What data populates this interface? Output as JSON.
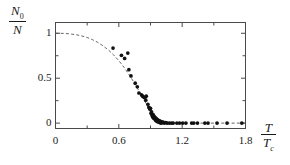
{
  "chart_data": {
    "type": "scatter",
    "title": "",
    "subtitle": "",
    "xlabel": "T/Tc",
    "xlabel_num": "T",
    "xlabel_den": "T",
    "xlabel_den_sub": "c",
    "ylabel": "N0/N",
    "ylabel_num": "N",
    "ylabel_num_sub": "0",
    "ylabel_den": "N",
    "xlim": [
      0,
      1.8
    ],
    "ylim": [
      -0.06,
      1.12
    ],
    "xticks": [
      0,
      0.6,
      1.2,
      1.8
    ],
    "xticklabels": [
      "0",
      "0.6",
      "1.2",
      "1.8"
    ],
    "xminorticks": [
      0.3,
      0.9,
      1.5
    ],
    "yticks": [
      0,
      0.5,
      1
    ],
    "yticklabels": [
      "0",
      "0.5",
      "1"
    ],
    "yminorticks": [
      0.25,
      0.75
    ],
    "grid": false,
    "legend": null,
    "series": [
      {
        "name": "theory",
        "type": "line",
        "style": "dashed",
        "color": "#555555",
        "x": [
          0.0,
          0.05,
          0.1,
          0.15,
          0.2,
          0.25,
          0.3,
          0.35,
          0.4,
          0.45,
          0.5,
          0.55,
          0.6,
          0.65,
          0.7,
          0.75,
          0.8,
          0.85,
          0.9,
          0.95,
          1.0,
          1.05,
          1.1,
          1.2,
          1.3,
          1.4,
          1.5,
          1.6,
          1.7,
          1.8
        ],
        "y": [
          1.0,
          1.0,
          0.997,
          0.991,
          0.983,
          0.97,
          0.953,
          0.929,
          0.899,
          0.861,
          0.815,
          0.76,
          0.695,
          0.62,
          0.535,
          0.44,
          0.34,
          0.235,
          0.125,
          0.04,
          0.0,
          0.0,
          0.0,
          0.0,
          0.0,
          0.0,
          0.0,
          0.0,
          0.0,
          0.0
        ]
      },
      {
        "name": "measured condensate fraction",
        "type": "scatter",
        "marker": "filled-circle",
        "color": "#111111",
        "points": [
          [
            0.545,
            0.835
          ],
          [
            0.625,
            0.755
          ],
          [
            0.655,
            0.72
          ],
          [
            0.685,
            0.78
          ],
          [
            0.695,
            0.595
          ],
          [
            0.715,
            0.525
          ],
          [
            0.755,
            0.445
          ],
          [
            0.775,
            0.405
          ],
          [
            0.79,
            0.335
          ],
          [
            0.815,
            0.315
          ],
          [
            0.825,
            0.3
          ],
          [
            0.84,
            0.285
          ],
          [
            0.85,
            0.29
          ],
          [
            0.855,
            0.255
          ],
          [
            0.86,
            0.3
          ],
          [
            0.875,
            0.21
          ],
          [
            0.885,
            0.175
          ],
          [
            0.895,
            0.155
          ],
          [
            0.9,
            0.165
          ],
          [
            0.905,
            0.11
          ],
          [
            0.91,
            0.125
          ],
          [
            0.915,
            0.085
          ],
          [
            0.92,
            0.07
          ],
          [
            0.925,
            0.095
          ],
          [
            0.93,
            0.055
          ],
          [
            0.935,
            0.075
          ],
          [
            0.94,
            0.045
          ],
          [
            0.945,
            0.06
          ],
          [
            0.95,
            0.03
          ],
          [
            0.955,
            0.05
          ],
          [
            0.96,
            0.02
          ],
          [
            0.965,
            0.04
          ],
          [
            0.97,
            0.015
          ],
          [
            0.975,
            0.03
          ],
          [
            0.98,
            0.01
          ],
          [
            0.985,
            0.025
          ],
          [
            0.99,
            0.005
          ],
          [
            0.995,
            0.02
          ],
          [
            1.0,
            0.0
          ],
          [
            1.005,
            0.015
          ],
          [
            1.01,
            0.005
          ],
          [
            1.02,
            0.01
          ],
          [
            1.03,
            0.0
          ],
          [
            1.045,
            0.005
          ],
          [
            1.06,
            0.0
          ],
          [
            1.08,
            0.0
          ],
          [
            1.1,
            0.0
          ],
          [
            1.115,
            0.0
          ],
          [
            1.15,
            0.0
          ],
          [
            1.175,
            0.0
          ],
          [
            1.205,
            0.0
          ],
          [
            1.235,
            0.0
          ],
          [
            1.29,
            0.0
          ],
          [
            1.31,
            0.0
          ],
          [
            1.345,
            0.0
          ],
          [
            1.415,
            0.0
          ],
          [
            1.445,
            0.0
          ],
          [
            1.53,
            0.0
          ],
          [
            1.625,
            0.0
          ],
          [
            1.765,
            0.0
          ]
        ]
      }
    ],
    "axis_color": "#4a4a4a",
    "marker_color": "#111111",
    "curve_color": "#555555",
    "background": "#ffffff"
  }
}
